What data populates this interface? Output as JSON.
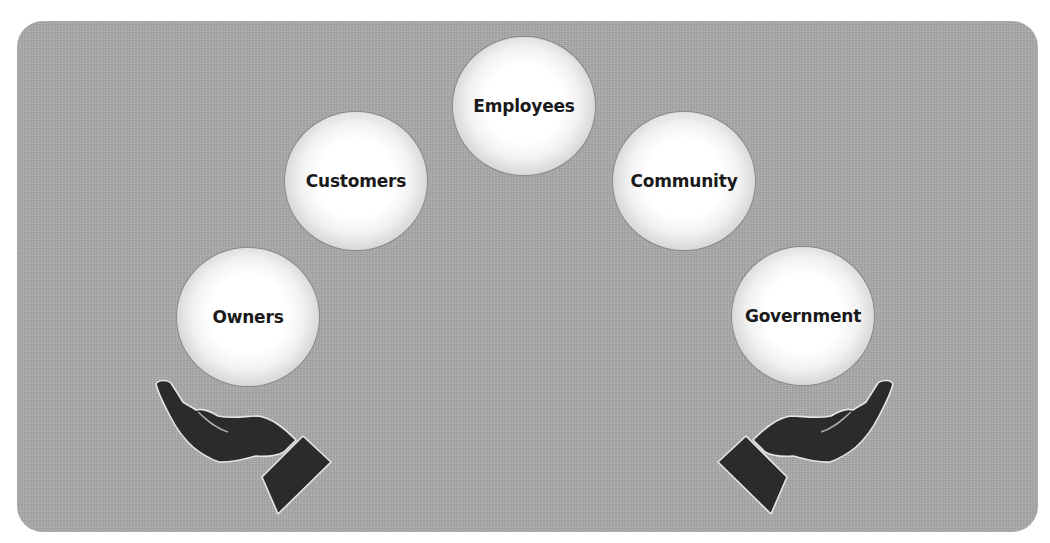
{
  "diagram": {
    "title": "",
    "panel_color": "#a9a9a9",
    "stakeholders": [
      {
        "label": "Owners",
        "cx": 248,
        "cy": 317
      },
      {
        "label": "Customers",
        "cx": 356,
        "cy": 181
      },
      {
        "label": "Employees",
        "cx": 524,
        "cy": 106
      },
      {
        "label": "Community",
        "cx": 684,
        "cy": 181
      },
      {
        "label": "Government",
        "cx": 803,
        "cy": 316
      }
    ],
    "hands": [
      {
        "side": "left",
        "icon": "open-hand-icon"
      },
      {
        "side": "right",
        "icon": "open-hand-icon"
      }
    ],
    "hand_color": "#2b2b2b"
  }
}
